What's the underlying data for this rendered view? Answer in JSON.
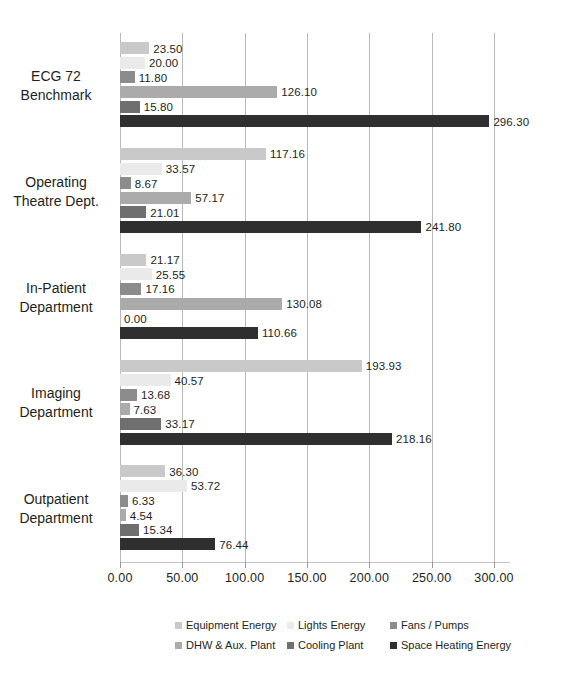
{
  "chart_data": {
    "type": "bar",
    "orientation": "horizontal",
    "title": "",
    "xlabel": "",
    "ylabel": "",
    "xlim": [
      0,
      300
    ],
    "xticks": [
      "0.00",
      "50.00",
      "100.00",
      "150.00",
      "200.00",
      "250.00",
      "300.00"
    ],
    "xtick_values": [
      0,
      50,
      100,
      150,
      200,
      250,
      300
    ],
    "grid": true,
    "legend_position": "bottom",
    "categories": [
      "ECG 72 Benchmark",
      "Operating Theatre Dept.",
      "In-Patient Department",
      "Imaging Department",
      "Outpatient Department"
    ],
    "category_lines": [
      [
        "ECG 72",
        "Benchmark"
      ],
      [
        "Operating",
        "Theatre Dept."
      ],
      [
        "In-Patient",
        "Department"
      ],
      [
        "Imaging",
        "Department"
      ],
      [
        "Outpatient",
        "Department"
      ]
    ],
    "series": [
      {
        "name": "Equipment Energy",
        "color": "#c9c9c9",
        "values": [
          23.5,
          117.16,
          21.17,
          193.93,
          36.3
        ],
        "labels": [
          "23.50",
          "117.16",
          "21.17",
          "193.93",
          "36.30"
        ]
      },
      {
        "name": "Lights Energy",
        "color": "#eaeaea",
        "values": [
          20.0,
          33.57,
          25.55,
          40.57,
          53.72
        ],
        "labels": [
          "20.00",
          "33.57",
          "25.55",
          "40.57",
          "53.72"
        ]
      },
      {
        "name": "Fans / Pumps",
        "color": "#8c8c8c",
        "values": [
          11.8,
          8.67,
          17.16,
          13.68,
          6.33
        ],
        "labels": [
          "11.80",
          "8.67",
          "17.16",
          "13.68",
          "6.33"
        ]
      },
      {
        "name": "DHW & Aux. Plant",
        "color": "#ababab",
        "values": [
          126.1,
          57.17,
          130.08,
          7.63,
          4.54
        ],
        "labels": [
          "126.10",
          "57.17",
          "130.08",
          "7.63",
          "4.54"
        ]
      },
      {
        "name": "Cooling Plant",
        "color": "#6f6f6f",
        "values": [
          15.8,
          21.01,
          0.0,
          33.17,
          15.34
        ],
        "labels": [
          "15.80",
          "21.01",
          "0.00",
          "33.17",
          "15.34"
        ]
      },
      {
        "name": "Space Heating Energy",
        "color": "#2f2f2f",
        "values": [
          296.3,
          241.8,
          110.66,
          218.16,
          76.44
        ],
        "labels": [
          "296.30",
          "241.80",
          "110.66",
          "218.16",
          "76.44"
        ]
      }
    ]
  },
  "legend": {
    "rows": [
      [
        "Equipment Energy",
        "Lights Energy",
        "Fans / Pumps"
      ],
      [
        "DHW & Aux. Plant",
        "Cooling Plant",
        "Space Heating Energy"
      ]
    ]
  }
}
